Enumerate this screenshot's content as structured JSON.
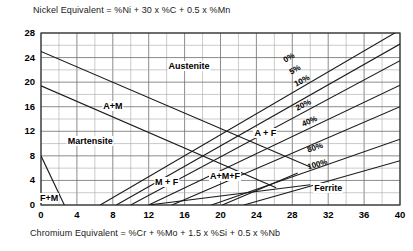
{
  "figure": {
    "top_equation": "Nickel Equivalent = %Ni + 30 x %C + 0.5 x %Mn",
    "bottom_equation": "Chromium   Equivalent = %Cr + %Mo + 1.5 x %Si + 0.5 x %Nb"
  },
  "chart_data": {
    "type": "line",
    "title": "",
    "xlabel": "Chromium   Equivalent = %Cr + %Mo + 1.5 x %Si + 0.5 x %Nb",
    "ylabel": "Nickel Equivalent = %Ni + 30 x %C + 0.5 x %Mn",
    "xlim": [
      0,
      40
    ],
    "ylim": [
      0,
      28
    ],
    "xticks": [
      0,
      4,
      8,
      12,
      16,
      20,
      24,
      28,
      32,
      36,
      40
    ],
    "yticks": [
      0,
      4,
      8,
      12,
      16,
      20,
      24,
      28
    ],
    "x_minor_step": 2,
    "y_minor_step": 2,
    "grid": true,
    "legend": "none",
    "regions": [
      {
        "label": "Austenite",
        "x": 16.5,
        "y": 22.5
      },
      {
        "label": "A+M",
        "x": 8.0,
        "y": 16.0
      },
      {
        "label": "Martensite",
        "x": 5.5,
        "y": 10.2
      },
      {
        "label": "M + F",
        "x": 14.0,
        "y": 3.6
      },
      {
        "label": "A+M+F",
        "x": 20.5,
        "y": 4.6
      },
      {
        "label": "A + F",
        "x": 25.0,
        "y": 11.6
      },
      {
        "label": "Ferrite",
        "x": 32.0,
        "y": 2.6
      },
      {
        "label": "F+M",
        "x": 0.9,
        "y": 0.9
      }
    ],
    "ferrite_lines": [
      {
        "name": "0%",
        "points": [
          [
            6.6,
            0.0
          ],
          [
            40.0,
            28.5
          ]
        ],
        "label_x": 28.0,
        "label_y": 23.0
      },
      {
        "name": "5%",
        "points": [
          [
            8.4,
            0.0
          ],
          [
            40.0,
            26.2
          ]
        ],
        "label_x": 28.6,
        "label_y": 21.0
      },
      {
        "name": "10%",
        "points": [
          [
            10.0,
            0.0
          ],
          [
            40.0,
            23.5
          ]
        ],
        "label_x": 29.4,
        "label_y": 19.0
      },
      {
        "name": "20%",
        "points": [
          [
            12.0,
            0.0
          ],
          [
            40.0,
            19.5
          ]
        ],
        "label_x": 29.5,
        "label_y": 15.2
      },
      {
        "name": "40%",
        "points": [
          [
            14.6,
            0.0
          ],
          [
            40.0,
            16.0
          ]
        ],
        "label_x": 30.2,
        "label_y": 12.6
      },
      {
        "name": "80%",
        "points": [
          [
            19.0,
            0.0
          ],
          [
            40.0,
            10.7
          ]
        ],
        "label_x": 30.7,
        "label_y": 8.3
      },
      {
        "name": "100%",
        "points": [
          [
            22.6,
            0.0
          ],
          [
            40.0,
            7.2
          ]
        ],
        "label_x": 31.0,
        "label_y": 5.6
      }
    ],
    "martensite_lines": [
      {
        "name": "austenite-martensite-upper",
        "points": [
          [
            0.0,
            25.0
          ],
          [
            30.0,
            6.2
          ]
        ]
      },
      {
        "name": "austenite-martensite-lower",
        "points": [
          [
            0.0,
            19.4
          ],
          [
            26.2,
            2.8
          ]
        ]
      },
      {
        "name": "martensite-ferrite-left",
        "points": [
          [
            0.0,
            8.0
          ],
          [
            2.6,
            0.0
          ]
        ]
      },
      {
        "name": "martensite-ferrite-lower",
        "points": [
          [
            12.0,
            0.0
          ],
          [
            30.0,
            3.3
          ]
        ]
      },
      {
        "name": "a-m-f-tie",
        "points": [
          [
            20.2,
            0.0
          ],
          [
            28.6,
            5.2
          ]
        ]
      }
    ]
  }
}
